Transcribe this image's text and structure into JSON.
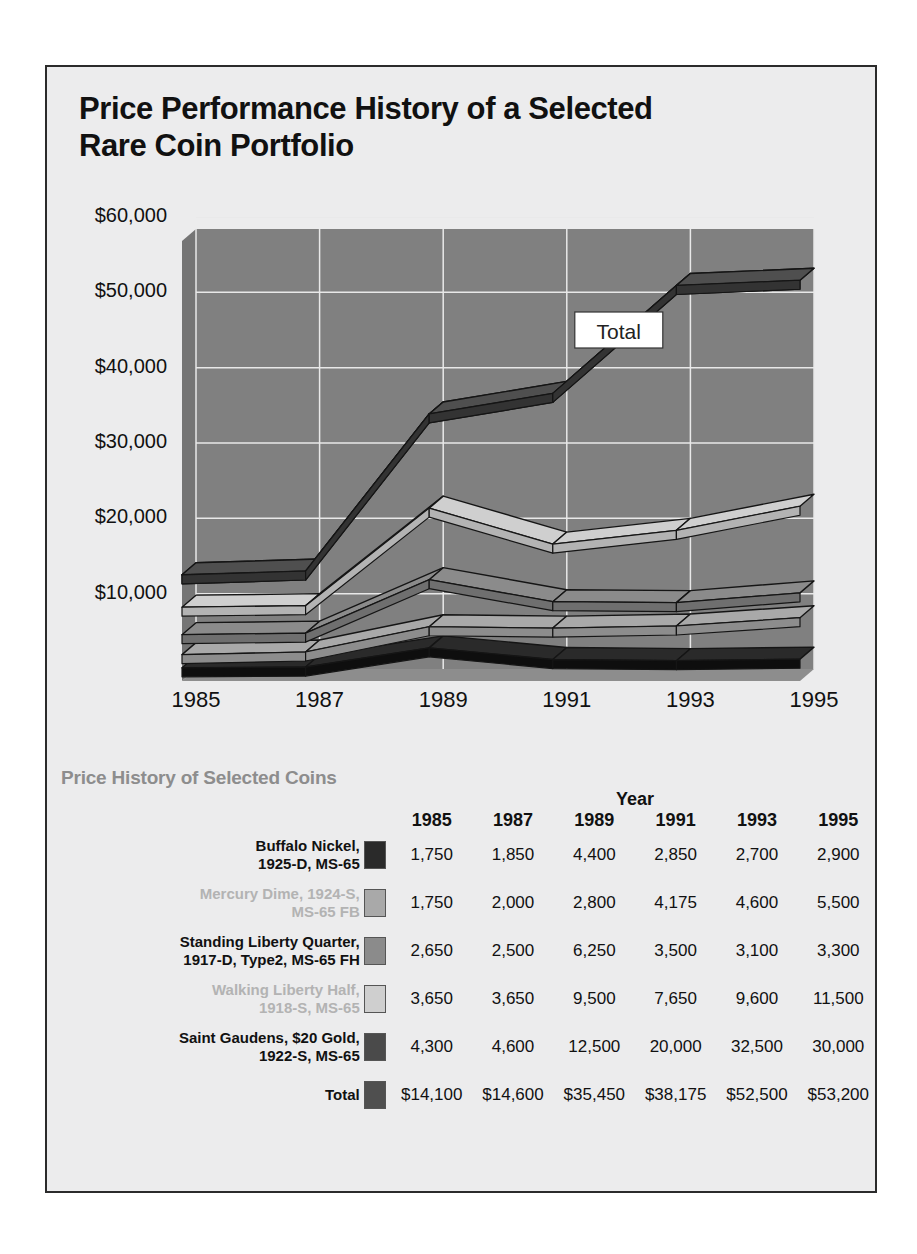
{
  "title": "Price Performance History of a\nSelected Rare Coin Portfolio",
  "chart_data": {
    "type": "area",
    "title": "Price Performance History of a Selected Rare Coin Portfolio",
    "xlabel": "",
    "ylabel": "",
    "grid": true,
    "ylim": [
      0,
      60000
    ],
    "yticks": [
      10000,
      20000,
      30000,
      40000,
      50000,
      60000
    ],
    "ytick_labels": [
      "$10,000",
      "$20,000",
      "$30,000",
      "$40,000",
      "$50,000",
      "$60,000"
    ],
    "x": [
      1985,
      1987,
      1989,
      1991,
      1993,
      1995
    ],
    "xtick_labels": [
      "1985",
      "1987",
      "1989",
      "1991",
      "1993",
      "1995"
    ],
    "annotations": [
      {
        "text": "Total",
        "x": 1991,
        "y": 45000
      }
    ],
    "series": [
      {
        "name": "Buffalo Nickel, 1925-D, MS-65",
        "values": [
          1750,
          1850,
          4400,
          2850,
          2700,
          2900
        ],
        "color": "#2a2a2a"
      },
      {
        "name": "Mercury Dime, 1924-S, MS-65 FB",
        "values": [
          1750,
          2000,
          2800,
          4175,
          4600,
          5500
        ],
        "color": "#a9a9a9"
      },
      {
        "name": "Standing Liberty Quarter, 1917-D, Type2, MS-65 FH",
        "values": [
          2650,
          2500,
          6250,
          3500,
          3100,
          3300
        ],
        "color": "#8b8b8b"
      },
      {
        "name": "Walking Liberty Half, 1918-S, MS-65",
        "values": [
          3650,
          3650,
          9500,
          7650,
          9600,
          11500
        ],
        "color": "#cfcfcf"
      },
      {
        "name": "Saint Gaudens, $20 Gold, 1922-S, MS-65",
        "values": [
          4300,
          4600,
          12500,
          20000,
          32500,
          30000
        ],
        "color": "#4a4a4a"
      },
      {
        "name": "Total",
        "values": [
          14100,
          14600,
          35450,
          38175,
          52500,
          53200
        ],
        "color": "#4f4f4f"
      }
    ],
    "plot_background": "#808080",
    "gridline_color": "#e8e8e8"
  },
  "table": {
    "section_title": "Price History of Selected Coins",
    "year_caption": "Year",
    "columns": [
      "1985",
      "1987",
      "1989",
      "1991",
      "1993",
      "1995"
    ],
    "rows": [
      {
        "label": "Buffalo Nickel,\n1925-D, MS-65",
        "tone": "dark",
        "swatch": "#2a2a2a",
        "values": [
          "1,750",
          "1,850",
          "4,400",
          "2,850",
          "2,700",
          "2,900"
        ]
      },
      {
        "label": "Mercury Dime, 1924-S,\nMS-65 FB",
        "tone": "light",
        "swatch": "#a9a9a9",
        "values": [
          "1,750",
          "2,000",
          "2,800",
          "4,175",
          "4,600",
          "5,500"
        ]
      },
      {
        "label": "Standing Liberty Quarter,\n1917-D, Type2, MS-65 FH",
        "tone": "dark",
        "swatch": "#8b8b8b",
        "values": [
          "2,650",
          "2,500",
          "6,250",
          "3,500",
          "3,100",
          "3,300"
        ]
      },
      {
        "label": "Walking Liberty Half,\n1918-S, MS-65",
        "tone": "light",
        "swatch": "#cfcfcf",
        "values": [
          "3,650",
          "3,650",
          "9,500",
          "7,650",
          "9,600",
          "11,500"
        ]
      },
      {
        "label": "Saint Gaudens, $20 Gold,\n1922-S, MS-65",
        "tone": "dark",
        "swatch": "#4a4a4a",
        "values": [
          "4,300",
          "4,600",
          "12,500",
          "20,000",
          "32,500",
          "30,000"
        ]
      },
      {
        "label": "Total",
        "tone": "dark",
        "swatch": "#4f4f4f",
        "values": [
          "$14,100",
          "$14,600",
          "$35,450",
          "$38,175",
          "$52,500",
          "$53,200"
        ]
      }
    ]
  }
}
